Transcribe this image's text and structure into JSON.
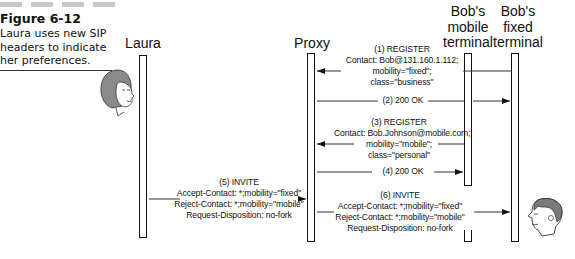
{
  "figure": {
    "number": "Figure 6-12",
    "caption": "Laura uses new SIP headers to indicate her preferences."
  },
  "actors": [
    {
      "id": "laura",
      "label": "Laura"
    },
    {
      "id": "proxy",
      "label": "Proxy"
    },
    {
      "id": "bob_mobile",
      "label": "Bob's mobile terminal"
    },
    {
      "id": "bob_fixed",
      "label": "Bob's fixed terminal"
    }
  ],
  "messages": [
    {
      "step": "(1) REGISTER",
      "from": "bob_fixed",
      "to": "proxy",
      "lines": [
        "(1) REGISTER",
        "Contact: Bob@131.160.1.112;",
        "mobility=\"fixed\";",
        "class=\"business\""
      ]
    },
    {
      "step": "(2) 200 OK",
      "from": "proxy",
      "to": "bob_fixed",
      "lines": [
        "(2) 200 OK"
      ]
    },
    {
      "step": "(3) REGISTER",
      "from": "bob_mobile",
      "to": "proxy",
      "lines": [
        "(3) REGISTER",
        "Contact: Bob.Johnson@mobile.com;",
        "mobility=\"mobile\";",
        "class=\"personal\""
      ]
    },
    {
      "step": "(4) 200 OK",
      "from": "proxy",
      "to": "bob_mobile",
      "lines": [
        "(4) 200 OK"
      ]
    },
    {
      "step": "(5) INVITE",
      "from": "laura",
      "to": "proxy",
      "lines": [
        "(5) INVITE",
        "Accept-Contact: *;mobility=\"fixed\"",
        "Reject-Contact: *;mobility=\"mobile\"",
        "Request-Disposition: no-fork"
      ]
    },
    {
      "step": "(6) INVITE",
      "from": "proxy",
      "to": "bob_fixed",
      "lines": [
        "(6) INVITE",
        "Accept-Contact: *;mobility=\"fixed\"",
        "Reject-Contact: *;mobility=\"mobile\"",
        "Request-Disposition: no-fork"
      ]
    }
  ],
  "icons": {
    "laura_face": "woman-face-icon",
    "bob_face": "man-face-icon"
  },
  "colors": {
    "line": "#111111",
    "caption_bars": "#c9c9c9",
    "background": "#ffffff"
  }
}
